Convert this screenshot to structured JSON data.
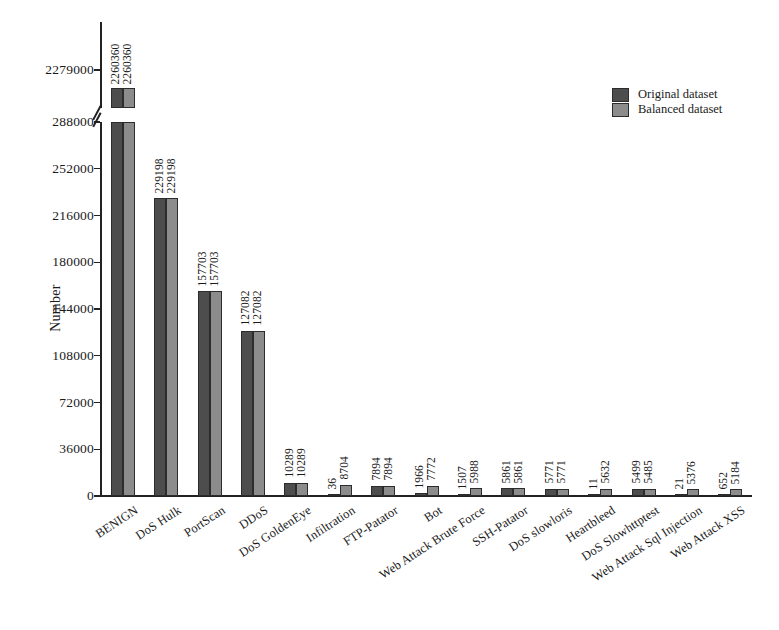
{
  "chart_data": {
    "type": "bar",
    "title": "",
    "xlabel": "",
    "ylabel": "Number",
    "ylim": [
      0,
      288000
    ],
    "broken_axis": true,
    "upper_ylim": [
      2243000,
      2279000
    ],
    "grid": false,
    "legend_position": "top-right",
    "y_ticks": [
      "0",
      "36000",
      "72000",
      "108000",
      "144000",
      "180000",
      "216000",
      "252000",
      "288000",
      "2279000"
    ],
    "y_tick_values": [
      0,
      36000,
      72000,
      108000,
      144000,
      180000,
      216000,
      252000,
      288000,
      2279000
    ],
    "categories": [
      "BENIGN",
      "DoS Hulk",
      "PortScan",
      "DDoS",
      "DoS GoldenEye",
      "Infiltration",
      "FTP-Patator",
      "Bot",
      "Web Attack Brute Force",
      "SSH-Patator",
      "DoS slowloris",
      "Heartbleed",
      "DoS Slowhttptest",
      "Web Attack Sql Injection",
      "Web Attack XSS"
    ],
    "series": [
      {
        "name": "Original dataset",
        "color": "#4d4d4d",
        "values": [
          2260360,
          229198,
          157703,
          127082,
          10289,
          36,
          7894,
          1966,
          1507,
          5861,
          5771,
          11,
          5499,
          21,
          652
        ]
      },
      {
        "name": "Balanced dataset",
        "color": "#8c8c8c",
        "values": [
          2260360,
          229198,
          157703,
          127082,
          10289,
          8704,
          7894,
          7772,
          5988,
          5861,
          5771,
          5632,
          5485,
          5376,
          5184
        ]
      }
    ],
    "data_labels": [
      [
        "2260360",
        "2260360"
      ],
      [
        "229198",
        "229198"
      ],
      [
        "157703",
        "157703"
      ],
      [
        "127082",
        "127082"
      ],
      [
        "10289",
        "10289"
      ],
      [
        "36",
        "8704"
      ],
      [
        "7894",
        "7894"
      ],
      [
        "1966",
        "7772"
      ],
      [
        "1507",
        "5988"
      ],
      [
        "5861",
        "5861"
      ],
      [
        "5771",
        "5771"
      ],
      [
        "11",
        "5632"
      ],
      [
        "5499",
        "5485"
      ],
      [
        "21",
        "5376"
      ],
      [
        "652",
        "5184"
      ]
    ]
  },
  "legend": {
    "items": [
      {
        "label": "Original dataset"
      },
      {
        "label": "Balanced dataset"
      }
    ]
  },
  "axis": {
    "y_title": "Number"
  }
}
